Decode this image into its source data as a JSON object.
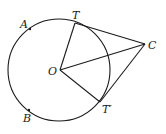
{
  "diagram": {
    "stroke_color": "#1a1a1a",
    "circle": {
      "cx": 59,
      "cy": 70,
      "r": 51
    },
    "points": {
      "O": {
        "label": "O",
        "x": 60,
        "y": 70
      },
      "T": {
        "label": "T",
        "x": 75,
        "y": 23
      },
      "T_prime": {
        "label": "T′",
        "x": 100,
        "y": 102
      },
      "C": {
        "label": "C",
        "x": 145,
        "y": 44
      },
      "A": {
        "label": "A",
        "x": 30,
        "y": 29
      },
      "B": {
        "label": "B",
        "x": 29,
        "y": 110
      }
    },
    "segments": [
      "OT",
      "OT′",
      "OC",
      "TC",
      "T′C"
    ]
  }
}
